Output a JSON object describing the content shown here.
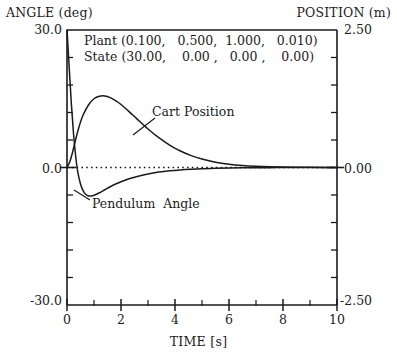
{
  "chart_data": {
    "type": "line",
    "title": "",
    "xlabel": "TIME   [s]",
    "ylabel_left": "ANGLE (deg)",
    "ylabel_right": "POSITION (m)",
    "xlim": [
      0,
      10
    ],
    "ylim_left": [
      -30.0,
      30.0
    ],
    "ylim_right": [
      -2.5,
      2.5
    ],
    "grid": false,
    "zero_line": true,
    "legend": "inline-annotations",
    "xticks": [
      0,
      2,
      4,
      6,
      8,
      10
    ],
    "xtick_labels": [
      "0",
      "2",
      "4",
      "6",
      "8",
      "10"
    ],
    "x_minor_ticks": [
      1,
      3,
      5,
      7,
      9
    ],
    "yticks_left": [
      -30.0,
      0.0,
      30.0
    ],
    "ytick_labels_left": [
      "-30.0",
      "0.0",
      "30.0"
    ],
    "yticks_right": [
      -2.5,
      0.0,
      2.5
    ],
    "ytick_labels_right": [
      "-2.50",
      "0.00",
      "2.50"
    ],
    "annotations": [
      {
        "name": "plant-parameters",
        "text": "Plant (0.100,   0.500,  1.000,   0.010)"
      },
      {
        "name": "state-parameters",
        "text": "State (30.00,    0.00 ,   0.00 ,    0.00)"
      },
      {
        "name": "cart-position-label",
        "text": "Cart Position"
      },
      {
        "name": "pendulum-angle-label",
        "text": "Pendulum  Angle"
      }
    ],
    "series": [
      {
        "name": "Pendulum Angle",
        "axis": "left",
        "units": "deg",
        "x": [
          0.0,
          0.08,
          0.16,
          0.24,
          0.32,
          0.4,
          0.5,
          0.6,
          0.7,
          0.8,
          0.9,
          1.0,
          1.2,
          1.4,
          1.6,
          1.8,
          2.0,
          2.3,
          2.6,
          3.0,
          3.4,
          3.8,
          4.2,
          4.6,
          5.0,
          5.5,
          6.0,
          6.5,
          7.0,
          7.5,
          8.0,
          8.5,
          9.0,
          9.5,
          10.0
        ],
        "values": [
          30.0,
          22.0,
          14.0,
          7.5,
          2.5,
          -1.0,
          -3.6,
          -5.1,
          -5.9,
          -6.2,
          -6.2,
          -6.05,
          -5.5,
          -4.85,
          -4.2,
          -3.6,
          -3.1,
          -2.45,
          -1.95,
          -1.4,
          -1.0,
          -0.72,
          -0.52,
          -0.38,
          -0.27,
          -0.18,
          -0.12,
          -0.08,
          -0.05,
          -0.035,
          -0.02,
          -0.015,
          -0.01,
          -0.005,
          0.0
        ]
      },
      {
        "name": "Cart Position",
        "axis": "right",
        "units": "m",
        "x": [
          0.0,
          0.1,
          0.2,
          0.3,
          0.4,
          0.5,
          0.6,
          0.8,
          1.0,
          1.2,
          1.4,
          1.6,
          1.8,
          2.0,
          2.3,
          2.6,
          3.0,
          3.4,
          3.8,
          4.2,
          4.6,
          5.0,
          5.5,
          6.0,
          6.5,
          7.0,
          7.5,
          8.0,
          8.5,
          9.0,
          9.5,
          10.0
        ],
        "values_deg_scale": [
          0.0,
          1.2,
          3.2,
          5.6,
          7.9,
          9.9,
          11.5,
          13.7,
          15.0,
          15.55,
          15.6,
          15.25,
          14.6,
          13.75,
          12.2,
          10.55,
          8.4,
          6.5,
          4.9,
          3.6,
          2.6,
          1.85,
          1.15,
          0.7,
          0.42,
          0.25,
          0.15,
          0.09,
          0.05,
          0.03,
          0.015,
          0.0
        ],
        "values": [
          0.0,
          0.1,
          0.267,
          0.467,
          0.658,
          0.825,
          0.958,
          1.142,
          1.25,
          1.296,
          1.3,
          1.271,
          1.217,
          1.146,
          1.017,
          0.879,
          0.7,
          0.542,
          0.408,
          0.3,
          0.217,
          0.154,
          0.096,
          0.058,
          0.035,
          0.021,
          0.013,
          0.008,
          0.004,
          0.003,
          0.001,
          0.0
        ]
      }
    ]
  },
  "axes": {
    "left_title": "ANGLE (deg)",
    "right_title": "POSITION (m)",
    "x_title": "TIME   [s]",
    "left_top": "30.0",
    "left_mid": "0.0",
    "left_bottom": "-30.0",
    "right_top": "2.50",
    "right_mid": "0.00",
    "right_bottom": "-2.50",
    "x0": "0",
    "x2": "2",
    "x4": "4",
    "x6": "6",
    "x8": "8",
    "x10": "10"
  },
  "annotations": {
    "plant": "Plant (0.100,   0.500,  1.000,   0.010)",
    "state": "State (30.00,    0.00 ,   0.00 ,    0.00)",
    "cart": "Cart Position",
    "pendulum": "Pendulum  Angle"
  },
  "colors": {
    "ink": "#1a1a1a",
    "background": "#ffffff",
    "curve": "#1a1a1a"
  }
}
